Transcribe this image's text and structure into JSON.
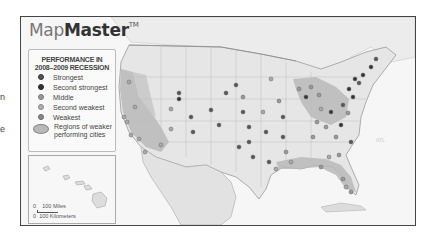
{
  "page": {
    "edge_fragments": [
      "n",
      "e"
    ]
  },
  "map": {
    "brand": {
      "light": "Map",
      "bold": "Master",
      "trademark": "TM"
    },
    "legend": {
      "title_line1": "PERFORMANCE IN",
      "title_line2": "2008–2009 RECESSION",
      "items": [
        {
          "label": "Strongest",
          "color": "#555555"
        },
        {
          "label": "Second strongest",
          "color": "#333333"
        },
        {
          "label": "Middle",
          "color": "#999999"
        },
        {
          "label": "Second weakest",
          "color": "#b0b0b0"
        },
        {
          "label": "Weakest",
          "color": "#8a8a8a"
        }
      ],
      "region_label_line1": "Regions of weaker",
      "region_label_line2": "performing cities"
    },
    "inset": {
      "name": "Hawaii",
      "scale_miles": "100 Miles",
      "scale_km": "100 Kilometers",
      "scale_zero": "0"
    },
    "colors": {
      "land": "#ededed",
      "water": "#f8f8f8",
      "weak_region": "#b5b5b5",
      "border": "#999999"
    }
  }
}
